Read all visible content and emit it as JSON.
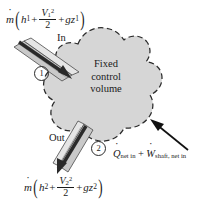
{
  "figure": {
    "type": "thermodynamics-control-volume-diagram",
    "background_color": "#ffffff",
    "blob_fill_color": "#d6d6d6",
    "blob_stroke_color": "#2b2b2b",
    "duct_fill_color": "#c9c9c9",
    "arrow_color": "#1a1a1a"
  },
  "control_volume": {
    "line1": "Fixed",
    "line2": "control",
    "line3": "volume"
  },
  "inlet": {
    "direction_label": "In",
    "station_marker": "1",
    "equation": {
      "mdot": "m",
      "open_paren": "(",
      "enthalpy": "h",
      "enthalpy_sub": "1",
      "plus1": "+",
      "velocity": "V",
      "velocity_sub": "1",
      "velocity_sup": "2",
      "denominator": "2",
      "plus2": "+",
      "gravity": "g",
      "elevation": "z",
      "elevation_sub": "1",
      "close_paren": ")"
    }
  },
  "outlet": {
    "direction_label": "Out",
    "station_marker": "2",
    "equation": {
      "mdot": "m",
      "open_paren": "(",
      "enthalpy": "h",
      "enthalpy_sub": "2",
      "plus1": "+",
      "velocity": "V",
      "velocity_sub": "2",
      "velocity_sup": "2",
      "denominator": "2",
      "plus2": "+",
      "gravity": "g",
      "elevation": "z",
      "elevation_sub": "2",
      "close_paren": ")"
    }
  },
  "energy_input": {
    "heat_symbol": "Q",
    "heat_subscript": "net in",
    "plus": "+",
    "work_symbol": "W",
    "work_subscript": "shaft, net in"
  }
}
